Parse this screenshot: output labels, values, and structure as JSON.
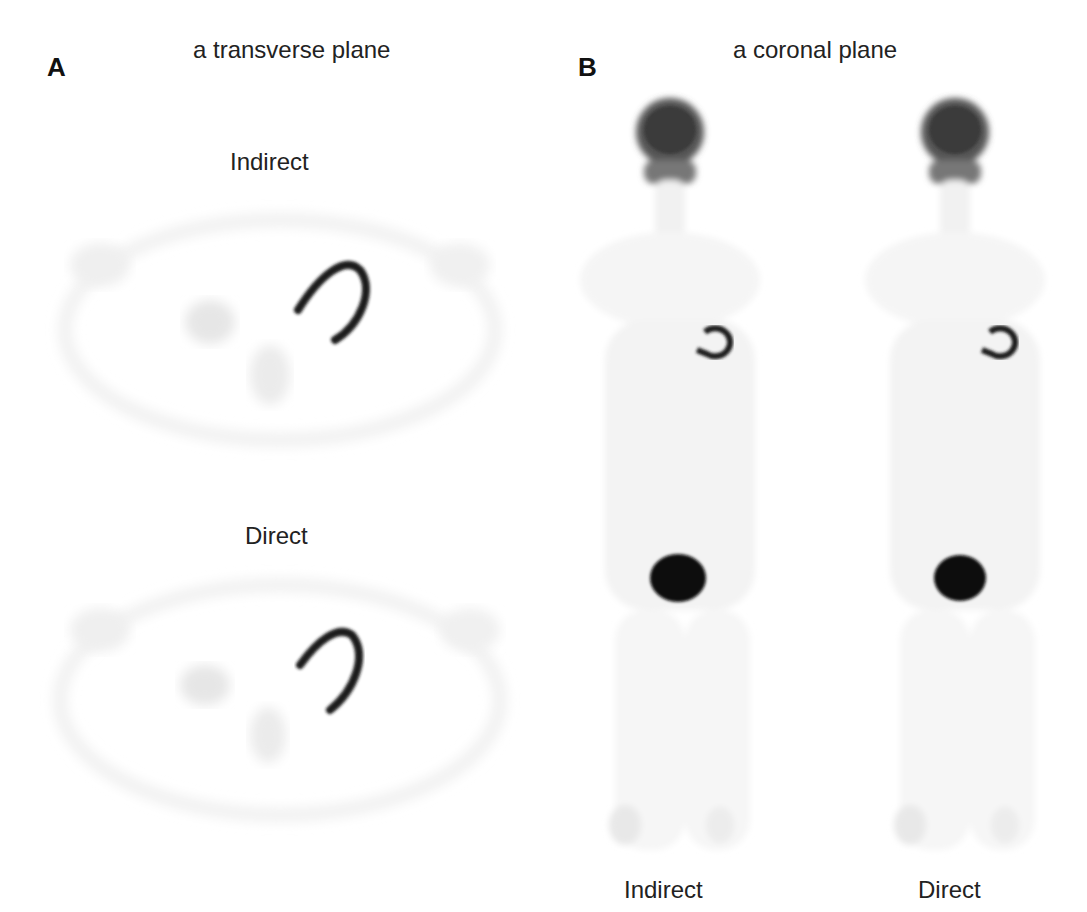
{
  "figure": {
    "panel_a": {
      "letter": "A",
      "title": "a transverse plane",
      "images": [
        {
          "label": "Indirect"
        },
        {
          "label": "Direct"
        }
      ]
    },
    "panel_b": {
      "letter": "B",
      "title": "a coronal plane",
      "images": [
        {
          "label": "Indirect"
        },
        {
          "label": "Direct"
        }
      ]
    },
    "colors": {
      "background": "#ffffff",
      "uptake_high": "#111111",
      "uptake_low": "#e6e6e6"
    }
  }
}
